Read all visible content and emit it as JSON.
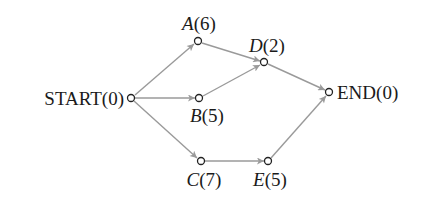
{
  "diagram": {
    "type": "network",
    "colors": {
      "edge": "#9a9a9a",
      "node_stroke": "#222222",
      "text": "#1a1a1a",
      "background": "#ffffff"
    },
    "nodes": [
      {
        "id": "START",
        "name": "START",
        "value": "(0)",
        "italic": false,
        "x": 131,
        "y": 98
      },
      {
        "id": "A",
        "name": "A",
        "value": "(6)",
        "italic": true,
        "x": 198,
        "y": 41
      },
      {
        "id": "B",
        "name": "B",
        "value": "(5)",
        "italic": true,
        "x": 199,
        "y": 98
      },
      {
        "id": "C",
        "name": "C",
        "value": "(7)",
        "italic": true,
        "x": 201,
        "y": 161
      },
      {
        "id": "D",
        "name": "D",
        "value": "(2)",
        "italic": true,
        "x": 264,
        "y": 62
      },
      {
        "id": "E",
        "name": "E",
        "value": "(5)",
        "italic": true,
        "x": 268,
        "y": 161
      },
      {
        "id": "END",
        "name": "END",
        "value": "(0)",
        "italic": false,
        "x": 329,
        "y": 92
      }
    ],
    "edges": [
      {
        "from": "START",
        "to": "A"
      },
      {
        "from": "START",
        "to": "B"
      },
      {
        "from": "START",
        "to": "C"
      },
      {
        "from": "A",
        "to": "D"
      },
      {
        "from": "B",
        "to": "D"
      },
      {
        "from": "D",
        "to": "END"
      },
      {
        "from": "C",
        "to": "E"
      },
      {
        "from": "E",
        "to": "END"
      }
    ]
  }
}
